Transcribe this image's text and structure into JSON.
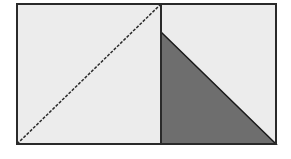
{
  "diagram": {
    "colors": {
      "background": "#ffffff",
      "fill_light": "#ececec",
      "fill_shaded": "#6e6e6e",
      "stroke": "#2a2a2a"
    },
    "outer_rect": {
      "x": 17,
      "y": 4,
      "width": 259,
      "height": 140
    },
    "divider_x": 161,
    "dashed_diagonal": {
      "x1": 17,
      "y1": 144,
      "x2": 161,
      "y2": 4
    },
    "shaded_triangle": {
      "points": "161,32 276,144 161,144"
    }
  }
}
